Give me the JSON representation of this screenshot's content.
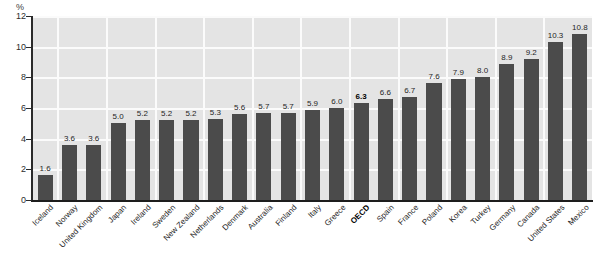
{
  "chart_data": {
    "type": "bar",
    "title": "",
    "subtitle": "",
    "xlabel": "",
    "ylabel": "%",
    "ylim": [
      0,
      12
    ],
    "yticks": [
      0,
      2,
      4,
      6,
      8,
      10,
      12
    ],
    "grid": true,
    "legend": "none",
    "orientation": "vertical",
    "highlight_category": "OECD",
    "bar_color": "#4b4b4b",
    "plot_background": "#e4e4e4",
    "gridline_color": "#fbfbfb",
    "axis_color": "#1d1d1d",
    "categories": [
      "Iceland",
      "Norway",
      "United Kingdom",
      "Japan",
      "Ireland",
      "Sweden",
      "New Zealand",
      "Netherlands",
      "Denmark",
      "Australia",
      "Finland",
      "Italy",
      "Greece",
      "OECD",
      "Spain",
      "France",
      "Poland",
      "Korea",
      "Turkey",
      "Germany",
      "Canada",
      "United States",
      "Mexico"
    ],
    "values": [
      1.6,
      3.6,
      3.6,
      5.0,
      5.2,
      5.2,
      5.2,
      5.3,
      5.6,
      5.7,
      5.7,
      5.9,
      6.0,
      6.3,
      6.6,
      6.7,
      7.6,
      7.9,
      8.0,
      8.9,
      9.2,
      10.3,
      10.8
    ],
    "value_labels": [
      "1.6",
      "3.6",
      "3.6",
      "5.0",
      "5.2",
      "5.2",
      "5.2",
      "5.3",
      "5.6",
      "5.7",
      "5.7",
      "5.9",
      "6.0",
      "6.3",
      "6.6",
      "6.7",
      "7.6",
      "7.9",
      "8.0",
      "8.9",
      "9.2",
      "10.3",
      "10.8"
    ],
    "ytick_labels": [
      "0",
      "2",
      "4",
      "6",
      "8",
      "10",
      "12"
    ]
  }
}
